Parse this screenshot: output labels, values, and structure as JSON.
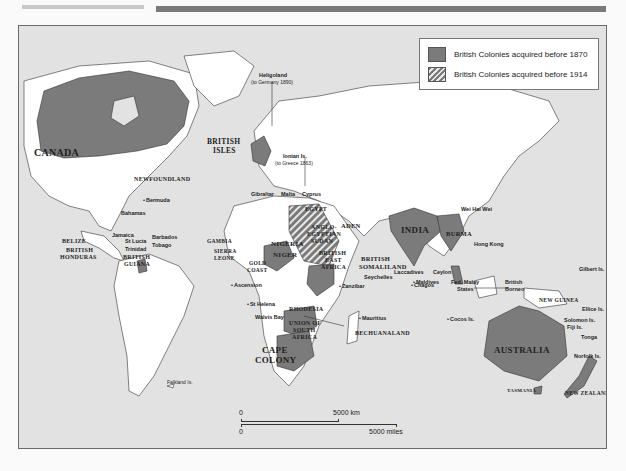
{
  "page": {
    "header_rules": [
      "light-grey-rule",
      "dark-grey-rule"
    ]
  },
  "map": {
    "colors": {
      "ocean": "#e2e2e2",
      "land": "#ffffff",
      "colony_before_1870": "#7b7b7b",
      "colony_before_1914": "hatched #7b7b7b/#e8e8e8"
    },
    "legend": {
      "items": [
        {
          "label": "British Colonies acquired before 1870",
          "style": "solid"
        },
        {
          "label": "British Colonies acquired before 1914",
          "style": "hatched"
        }
      ]
    },
    "labels": {
      "canada": "CANADA",
      "newfoundland": "NEWFOUNDLAND",
      "british_isles_1": "BRITISH",
      "british_isles_2": "ISLES",
      "heligoland": "Heligoland",
      "heligoland_note": "(to Germany 1890)",
      "ionian": "Ionian Is.",
      "ionian_note": "(to Greece 1863)",
      "gibraltar": "Gibraltar",
      "malta": "Malta",
      "cyprus": "Cyprus",
      "bermuda": "Bermuda",
      "bahamas": "Bahamas",
      "jamaica": "Jamaica",
      "barbados": "Barbados",
      "st_lucia": "St Lucia",
      "tobago": "Tobago",
      "trinidad": "Trinidad",
      "belize": "BELIZE",
      "british_honduras_1": "BRITISH",
      "british_honduras_2": "HONDURAS",
      "british_guiana_1": "BRITISH",
      "british_guiana_2": "GUIANA",
      "gambia": "GAMBIA",
      "sierra_leone_1": "SIERRA",
      "sierra_leone_2": "LEONE",
      "gold_coast_1": "GOLD",
      "gold_coast_2": "COAST",
      "nigeria": "NIGERIA",
      "niger": "NIGER",
      "egypt": "EGYPT",
      "anglo_egyptian_sudan_1": "ANGLO-",
      "anglo_egyptian_sudan_2": "EGYPTIAN",
      "anglo_egyptian_sudan_3": "SUDAN",
      "aden": "ADEN",
      "british_east_africa_1": "BRITISH",
      "british_east_africa_2": "EAST",
      "british_east_africa_3": "AFRICA",
      "british_somaliland_1": "BRITISH",
      "british_somaliland_2": "SOMALILAND",
      "seychelles": "Seychelles",
      "zanzibar": "Zanzibar",
      "ascension": "Ascension",
      "st_helena": "St Helena",
      "walvis_bay": "Walvis Bay",
      "rhodesia": "RHODESIA",
      "union_sa_1": "UNION OF",
      "union_sa_2": "SOUTH",
      "union_sa_3": "AFRICA",
      "bechuanaland": "BECHUANALAND",
      "cape_colony_1": "CAPE",
      "cape_colony_2": "COLONY",
      "mauritius": "Mauritius",
      "chagos": "Chagos",
      "laccadives": "Laccadives",
      "maldives": "Maldives",
      "ceylon": "Ceylon",
      "india": "INDIA",
      "burma": "BURMA",
      "wei_hai_wei": "Wei Hai Wei",
      "hong_kong": "Hong Kong",
      "fed_malay_1": "Fed. Malay",
      "fed_malay_2": "States",
      "british_borneo_1": "British",
      "british_borneo_2": "Borneo",
      "cocos": "Cocos Is.",
      "new_guinea": "NEW GUINEA",
      "gilbert": "Gilbert Is.",
      "ellice": "Ellice Is.",
      "solomon": "Solomon Is.",
      "fiji": "Fiji Is.",
      "tonga": "Tonga",
      "norfolk": "Norfolk Is.",
      "australia": "AUSTRALIA",
      "tasmania": "TASMANIA",
      "new_zealand": "NEW ZEALAND",
      "falkland": "Falkland Is."
    },
    "scale_bar": {
      "km_start": "0",
      "km_end": "5000 km",
      "miles_start": "0",
      "miles_end": "5000 miles"
    }
  }
}
